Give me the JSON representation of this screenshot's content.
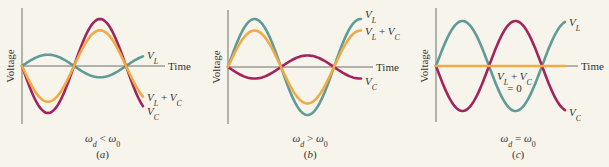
{
  "figure": {
    "background": "#f7f4eb",
    "colors": {
      "VL": "#5f9c98",
      "VC": "#a3245c",
      "VLVC": "#f2aa44",
      "axis": "#6f6f6f",
      "text": "#333333"
    },
    "axis_labels": {
      "y": "Voltage",
      "x": "Time"
    }
  },
  "chart_data": [
    {
      "type": "line",
      "panel": "(a)",
      "condition": "ωd < ω0",
      "xlabel": "Time",
      "ylabel": "Voltage",
      "grid": false,
      "legend": "inline labels at curve ends",
      "x_range_periods": 1.25,
      "series": [
        {
          "name": "VL",
          "label": "V_L",
          "amplitude": 0.24,
          "phase": "sin",
          "sign": 1
        },
        {
          "name": "VC",
          "label": "V_C",
          "amplitude": 1.0,
          "phase": "sin",
          "sign": -1
        },
        {
          "name": "VL+VC",
          "label": "V_L + V_C",
          "amplitude": 0.76,
          "phase": "sin",
          "sign": -1
        }
      ]
    },
    {
      "type": "line",
      "panel": "(b)",
      "condition": "ωd > ω0",
      "xlabel": "Time",
      "ylabel": "Voltage",
      "grid": false,
      "legend": "inline labels at curve ends",
      "x_range_periods": 1.25,
      "series": [
        {
          "name": "VL",
          "label": "V_L",
          "amplitude": 1.0,
          "phase": "sin",
          "sign": 1
        },
        {
          "name": "VC",
          "label": "V_C",
          "amplitude": 0.24,
          "phase": "sin",
          "sign": -1
        },
        {
          "name": "VL+VC",
          "label": "V_L + V_C",
          "amplitude": 0.76,
          "phase": "sin",
          "sign": 1
        }
      ]
    },
    {
      "type": "line",
      "panel": "(c)",
      "condition": "ωd = ω0",
      "xlabel": "Time",
      "ylabel": "Voltage",
      "grid": false,
      "legend": "inline labels at curve ends",
      "x_range_periods": 1.25,
      "annotation": "V_L + V_C = 0",
      "series": [
        {
          "name": "VL",
          "label": "V_L",
          "amplitude": 1.0,
          "phase": "sin",
          "sign": 1
        },
        {
          "name": "VC",
          "label": "V_C",
          "amplitude": 1.0,
          "phase": "sin",
          "sign": -1
        },
        {
          "name": "VL+VC",
          "label": "V_L + V_C",
          "amplitude": 0.0,
          "phase": "sin",
          "sign": 1
        }
      ]
    }
  ],
  "panels": [
    {
      "caption_omega": "ω",
      "caption_sub_left": "d",
      "caption_rel": "<",
      "caption_sub_right": "0",
      "tag": "(a)",
      "layout": {
        "x0": 22,
        "y0": 66,
        "yTop": 8,
        "yBot": 124,
        "xEnd": 143,
        "axisEnd": 165,
        "half": 52,
        "amp": 47
      }
    },
    {
      "caption_omega": "ω",
      "caption_sub_left": "d",
      "caption_rel": ">",
      "caption_sub_right": "0",
      "tag": "(b)",
      "layout": {
        "x0": 228,
        "y0": 67,
        "yTop": 10,
        "yBot": 124,
        "xEnd": 361,
        "axisEnd": 373,
        "half": 53,
        "amp": 48
      }
    },
    {
      "caption_omega": "ω",
      "caption_sub_left": "d",
      "caption_rel": "=",
      "caption_sub_right": "0",
      "tag": "(c)",
      "layout": {
        "x0": 436,
        "y0": 66,
        "yTop": 8,
        "yBot": 122,
        "xEnd": 565,
        "axisEnd": 578,
        "half": 53,
        "amp": 45
      }
    }
  ],
  "labels": {
    "VL": {
      "main": "V",
      "sub": "L"
    },
    "VC": {
      "main": "V",
      "sub": "C"
    },
    "plus": "+",
    "equals_zero": "= 0"
  }
}
